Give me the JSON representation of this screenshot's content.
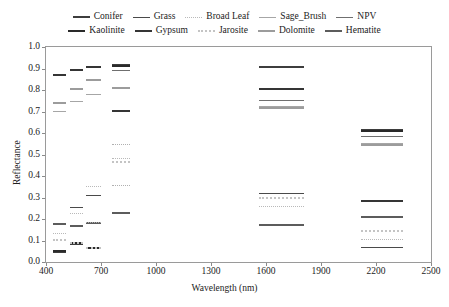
{
  "chart_data": {
    "type": "line",
    "title": "",
    "xlabel": "Wavelength (nm)",
    "ylabel": "Reflectance",
    "xlim": [
      400,
      2500
    ],
    "ylim": [
      0.0,
      1.0
    ],
    "xticks": [
      400,
      700,
      1000,
      1300,
      1600,
      1900,
      2200,
      2500
    ],
    "yticks": [
      "0.0",
      "0.1",
      "0.2",
      "0.3",
      "0.4",
      "0.5",
      "0.6",
      "0.7",
      "0.8",
      "0.9",
      "1.0"
    ],
    "grid": false,
    "legend_position": "top",
    "note": "Each series is drawn as short flat horizontal band segments (spectral band means) at discrete wavelength clusters.",
    "series": [
      {
        "name": "Conifer",
        "color": "#3d3d3d",
        "style": "solid",
        "width": 2.0,
        "segments": [
          {
            "x0": 440,
            "x1": 510,
            "y": 0.045
          },
          {
            "x0": 530,
            "x1": 600,
            "y": 0.086
          },
          {
            "x0": 620,
            "x1": 700,
            "y": 0.066
          },
          {
            "x0": 760,
            "x1": 860,
            "y": 0.915
          },
          {
            "x0": 1560,
            "x1": 1810,
            "y": 0.908
          },
          {
            "x0": 2120,
            "x1": 2350,
            "y": 0.614
          }
        ]
      },
      {
        "name": "Grass",
        "color": "#4a4a4a",
        "style": "solid",
        "width": 1.6,
        "segments": [
          {
            "x0": 440,
            "x1": 510,
            "y": 0.175
          },
          {
            "x0": 530,
            "x1": 600,
            "y": 0.254
          },
          {
            "x0": 620,
            "x1": 700,
            "y": 0.308
          },
          {
            "x0": 760,
            "x1": 860,
            "y": 0.889
          },
          {
            "x0": 1560,
            "x1": 1810,
            "y": 0.318
          },
          {
            "x0": 2120,
            "x1": 2350,
            "y": 0.067
          }
        ]
      },
      {
        "name": "Broad Leaf",
        "color": "#b9b9b9",
        "style": "dotted",
        "width": 1.6,
        "segments": [
          {
            "x0": 440,
            "x1": 510,
            "y": 0.132
          },
          {
            "x0": 530,
            "x1": 600,
            "y": 0.224
          },
          {
            "x0": 620,
            "x1": 700,
            "y": 0.349
          },
          {
            "x0": 760,
            "x1": 860,
            "y": 0.482
          },
          {
            "x0": 1560,
            "x1": 1810,
            "y": 0.258
          },
          {
            "x0": 2120,
            "x1": 2350,
            "y": 0.104
          }
        ]
      },
      {
        "name": "Sage_Brush",
        "color": "#a6a6a6",
        "style": "solid",
        "width": 1.6,
        "segments": [
          {
            "x0": 440,
            "x1": 510,
            "y": 0.7
          },
          {
            "x0": 530,
            "x1": 600,
            "y": 0.747
          },
          {
            "x0": 620,
            "x1": 700,
            "y": 0.779
          },
          {
            "x0": 760,
            "x1": 860,
            "y": 0.807
          },
          {
            "x0": 1560,
            "x1": 1810,
            "y": 0.722
          },
          {
            "x0": 2120,
            "x1": 2350,
            "y": 0.548
          }
        ]
      },
      {
        "name": "NPV",
        "color": "#6f6f6f",
        "style": "solid",
        "width": 1.6,
        "segments": [
          {
            "x0": 440,
            "x1": 510,
            "y": 0.735
          },
          {
            "x0": 530,
            "x1": 600,
            "y": 0.807
          },
          {
            "x0": 620,
            "x1": 700,
            "y": 0.847
          },
          {
            "x0": 760,
            "x1": 860,
            "y": 0.889
          },
          {
            "x0": 1560,
            "x1": 1810,
            "y": 0.748
          },
          {
            "x0": 2120,
            "x1": 2350,
            "y": 0.584
          }
        ]
      },
      {
        "name": "Kaolinite",
        "color": "#2a2a2a",
        "style": "solid",
        "width": 2.3,
        "segments": [
          {
            "x0": 440,
            "x1": 510,
            "y": 0.049
          },
          {
            "x0": 530,
            "x1": 600,
            "y": 0.088
          },
          {
            "x0": 620,
            "x1": 700,
            "y": 0.064
          },
          {
            "x0": 760,
            "x1": 860,
            "y": 0.912
          },
          {
            "x0": 1560,
            "x1": 1810,
            "y": 0.172
          },
          {
            "x0": 2120,
            "x1": 2350,
            "y": 0.61
          }
        ]
      },
      {
        "name": "Gypsum",
        "color": "#353535",
        "style": "solid",
        "width": 2.2,
        "segments": [
          {
            "x0": 440,
            "x1": 510,
            "y": 0.871
          },
          {
            "x0": 530,
            "x1": 600,
            "y": 0.893
          },
          {
            "x0": 620,
            "x1": 700,
            "y": 0.908
          },
          {
            "x0": 760,
            "x1": 860,
            "y": 0.7
          },
          {
            "x0": 1560,
            "x1": 1810,
            "y": 0.805
          },
          {
            "x0": 2120,
            "x1": 2350,
            "y": 0.285
          }
        ]
      },
      {
        "name": "Jarosite",
        "color": "#c4c4c4",
        "style": "dotted",
        "width": 2.0,
        "segments": [
          {
            "x0": 440,
            "x1": 510,
            "y": 0.102
          },
          {
            "x0": 530,
            "x1": 600,
            "y": 0.087
          },
          {
            "x0": 620,
            "x1": 700,
            "y": 0.065
          },
          {
            "x0": 760,
            "x1": 860,
            "y": 0.467
          },
          {
            "x0": 1560,
            "x1": 1810,
            "y": 0.296
          },
          {
            "x0": 2120,
            "x1": 2350,
            "y": 0.146
          }
        ]
      },
      {
        "name": "Dolomite",
        "color": "#9c9c9c",
        "style": "solid",
        "width": 2.2,
        "segments": [
          {
            "x0": 440,
            "x1": 510,
            "y": 0.74
          },
          {
            "x0": 530,
            "x1": 600,
            "y": 0.802
          },
          {
            "x0": 620,
            "x1": 700,
            "y": 0.846
          },
          {
            "x0": 760,
            "x1": 860,
            "y": 0.807
          },
          {
            "x0": 1560,
            "x1": 1810,
            "y": 0.718
          },
          {
            "x0": 2120,
            "x1": 2350,
            "y": 0.546
          }
        ]
      },
      {
        "name": "Hematite",
        "color": "#5c5c5c",
        "style": "solid",
        "width": 2.2,
        "segments": [
          {
            "x0": 440,
            "x1": 510,
            "y": 0.177
          },
          {
            "x0": 530,
            "x1": 600,
            "y": 0.166
          },
          {
            "x0": 620,
            "x1": 700,
            "y": 0.18
          },
          {
            "x0": 760,
            "x1": 860,
            "y": 0.228
          },
          {
            "x0": 1560,
            "x1": 1810,
            "y": 0.173
          },
          {
            "x0": 2120,
            "x1": 2350,
            "y": 0.207
          }
        ]
      },
      {
        "name": "Jarosite-extra",
        "color": "#b0b0b0",
        "style": "dotted",
        "width": 1.8,
        "hidden_from_legend": true,
        "segments": [
          {
            "x0": 760,
            "x1": 860,
            "y": 0.352
          },
          {
            "x0": 760,
            "x1": 860,
            "y": 0.545
          },
          {
            "x0": 620,
            "x1": 700,
            "y": 0.182
          }
        ]
      }
    ]
  },
  "legend": {
    "rows": [
      [
        "Conifer",
        "Grass",
        "Broad Leaf",
        "Sage_Brush",
        "NPV"
      ],
      [
        "Kaolinite",
        "Gypsum",
        "Jarosite",
        "Dolomite",
        "Hematite"
      ]
    ]
  }
}
